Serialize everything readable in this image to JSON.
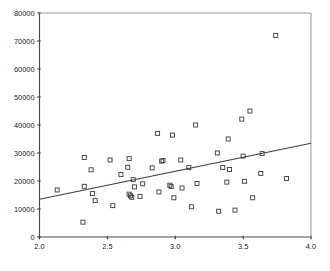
{
  "chart_data": {
    "type": "scatter",
    "title": "",
    "subtitle": "",
    "xlabel": "",
    "ylabel": "",
    "xlim": [
      2.0,
      4.0
    ],
    "ylim": [
      0,
      80000
    ],
    "grid": false,
    "legend": null,
    "xticks": [
      "2.0",
      "2.5",
      "3.0",
      "3.5",
      "4.0"
    ],
    "xtick_values": [
      2.0,
      2.5,
      3.0,
      3.5,
      4.0
    ],
    "yticks": [
      "0",
      "10000",
      "20000",
      "30000",
      "40000",
      "50000",
      "60000",
      "70000",
      "80000"
    ],
    "ytick_values": [
      0,
      10000,
      20000,
      30000,
      40000,
      50000,
      60000,
      70000,
      80000
    ],
    "marker": "open-square",
    "marker_size": 4,
    "points": [
      {
        "x": 2.13,
        "y": 16800
      },
      {
        "x": 2.32,
        "y": 5300
      },
      {
        "x": 2.33,
        "y": 28400
      },
      {
        "x": 2.33,
        "y": 18100
      },
      {
        "x": 2.38,
        "y": 24000
      },
      {
        "x": 2.39,
        "y": 15500
      },
      {
        "x": 2.41,
        "y": 13000
      },
      {
        "x": 2.52,
        "y": 27500
      },
      {
        "x": 2.54,
        "y": 11200
      },
      {
        "x": 2.6,
        "y": 22300
      },
      {
        "x": 2.65,
        "y": 24900
      },
      {
        "x": 2.66,
        "y": 28000
      },
      {
        "x": 2.66,
        "y": 15300
      },
      {
        "x": 2.67,
        "y": 14700
      },
      {
        "x": 2.68,
        "y": 14200
      },
      {
        "x": 2.69,
        "y": 20500
      },
      {
        "x": 2.7,
        "y": 17900
      },
      {
        "x": 2.74,
        "y": 14500
      },
      {
        "x": 2.76,
        "y": 19000
      },
      {
        "x": 2.83,
        "y": 24700
      },
      {
        "x": 2.87,
        "y": 37000
      },
      {
        "x": 2.88,
        "y": 16100
      },
      {
        "x": 2.9,
        "y": 27100
      },
      {
        "x": 2.91,
        "y": 27300
      },
      {
        "x": 2.96,
        "y": 18500
      },
      {
        "x": 2.97,
        "y": 18000
      },
      {
        "x": 2.98,
        "y": 36400
      },
      {
        "x": 2.99,
        "y": 14000
      },
      {
        "x": 3.04,
        "y": 27500
      },
      {
        "x": 3.05,
        "y": 17500
      },
      {
        "x": 3.1,
        "y": 24800
      },
      {
        "x": 3.12,
        "y": 10800
      },
      {
        "x": 3.15,
        "y": 40000
      },
      {
        "x": 3.16,
        "y": 19100
      },
      {
        "x": 3.31,
        "y": 30000
      },
      {
        "x": 3.32,
        "y": 9200
      },
      {
        "x": 3.35,
        "y": 24800
      },
      {
        "x": 3.38,
        "y": 19600
      },
      {
        "x": 3.39,
        "y": 35000
      },
      {
        "x": 3.4,
        "y": 24100
      },
      {
        "x": 3.44,
        "y": 9600
      },
      {
        "x": 3.49,
        "y": 42100
      },
      {
        "x": 3.5,
        "y": 28900
      },
      {
        "x": 3.51,
        "y": 19900
      },
      {
        "x": 3.55,
        "y": 45000
      },
      {
        "x": 3.57,
        "y": 14000
      },
      {
        "x": 3.63,
        "y": 22700
      },
      {
        "x": 3.64,
        "y": 29800
      },
      {
        "x": 3.74,
        "y": 72000
      },
      {
        "x": 3.82,
        "y": 20900
      }
    ],
    "fit_line": {
      "type": "linear-regression",
      "x_start": 2.0,
      "y_start": 13500,
      "x_end": 4.0,
      "y_end": 33500
    }
  }
}
